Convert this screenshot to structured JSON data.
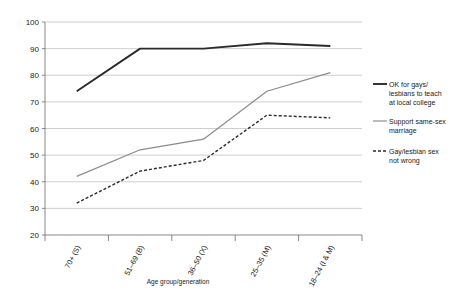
{
  "chart_data": {
    "type": "line",
    "title": "",
    "xlabel": "Age group/generation",
    "ylabel": "",
    "ylim": [
      20,
      100
    ],
    "yticks": [
      20,
      30,
      40,
      50,
      60,
      70,
      80,
      90,
      100
    ],
    "ytick_labels": [
      "20",
      "30",
      "40",
      "50",
      "60",
      "70",
      "80",
      "90",
      "100"
    ],
    "grid": true,
    "legend_position": "right",
    "categories": [
      "70+ (S)",
      "51–69 (B)",
      "36–50 (X)",
      "25–35 (M)",
      "18–24 (I & M)"
    ],
    "series": [
      {
        "name": "OK for gays/lesbians to teach at local college",
        "style": "solid",
        "color": "#2b2b2b",
        "width": 1.9,
        "values": [
          74,
          90,
          90,
          92,
          91
        ]
      },
      {
        "name": "Support same-sex marriage",
        "style": "solid",
        "color": "#8c8c8c",
        "width": 1.2,
        "values": [
          42,
          52,
          56,
          74,
          81
        ]
      },
      {
        "name": "Gay/lesbian sex not wrong",
        "style": "dashed",
        "color": "#2b2b2b",
        "width": 1.4,
        "values": [
          32,
          44,
          48,
          65,
          64
        ]
      }
    ]
  },
  "axis": {
    "x_title": "Age group/generation",
    "y_ticks": [
      "100",
      "90",
      "80",
      "70",
      "60",
      "50",
      "40",
      "30",
      "20"
    ],
    "x_categories": [
      "70+ (S)",
      "51–69 (B)",
      "36–50 (X)",
      "25–35 (M)",
      "18–24 (I & M)"
    ]
  },
  "legend": {
    "items": [
      {
        "label_line1": "OK for gays/",
        "label_line2": "lesbians to teach",
        "label_line3": "at local college",
        "swatch": "solid-dark"
      },
      {
        "label_line1": "Support same-sex",
        "label_line2": "marriage",
        "label_line3": "",
        "swatch": "solid-gray"
      },
      {
        "label_line1": "Gay/lesbian sex",
        "label_line2": "not wrong",
        "label_line3": "",
        "swatch": "dashed-dark"
      }
    ]
  },
  "colors": {
    "series_dark": "#2b2b2b",
    "series_gray": "#8c8c8c",
    "grid": "#b9b9b9",
    "axis": "#6b6b6b",
    "background": "#ffffff"
  }
}
